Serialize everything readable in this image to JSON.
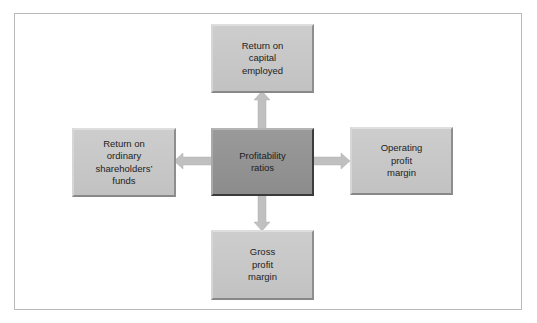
{
  "diagram": {
    "center": {
      "label": "Profitability\nratios"
    },
    "nodes": {
      "top": {
        "label": "Return on\ncapital\nemployed"
      },
      "left": {
        "label": "Return on\nordinary\nshareholders’\nfunds"
      },
      "right": {
        "label": "Operating\nprofit\nmargin"
      },
      "bottom": {
        "label": "Gross\nprofit\nmargin"
      }
    },
    "arrows": [
      {
        "from": "center",
        "to": "top",
        "direction": "up"
      },
      {
        "from": "center",
        "to": "left",
        "direction": "left"
      },
      {
        "from": "center",
        "to": "right",
        "direction": "right"
      },
      {
        "from": "center",
        "to": "bottom",
        "direction": "down"
      }
    ],
    "colors": {
      "node_fill": "#c6c6c6",
      "center_fill": "#939393",
      "arrow_fill": "#c0c0c0",
      "frame_border": "#b9b9b9"
    }
  }
}
